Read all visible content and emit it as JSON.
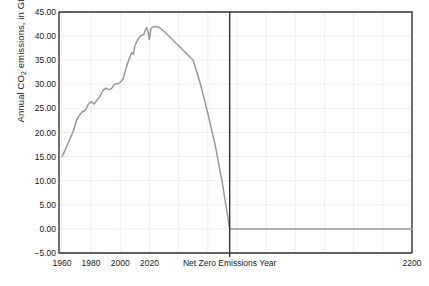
{
  "chart_data": {
    "type": "line",
    "title": "",
    "xlabel": "",
    "ylabel": "Annual CO2 emissions, in GtCO2",
    "ylabel_parts": {
      "prefix": "Annual CO",
      "sub1": "2",
      "middle": " emissions, in GtCO",
      "sub2": "2"
    },
    "ylim": [
      -5,
      45
    ],
    "yticks": [
      "-5.00",
      "0.00",
      "5.00",
      "10.00",
      "15.00",
      "20.00",
      "25.00",
      "30.00",
      "35.00",
      "40.00",
      "45.00"
    ],
    "ytick_values": [
      -5,
      0,
      5,
      10,
      15,
      20,
      25,
      30,
      35,
      40,
      45
    ],
    "xticks": [
      "1960",
      "1980",
      "2000",
      "2020",
      "Net Zero Emissions Year",
      "2200"
    ],
    "xtick_values": [
      1960,
      1980,
      2000,
      2020,
      2075,
      2200
    ],
    "xlim": [
      1958,
      2200
    ],
    "grid": true,
    "legend": "none",
    "net_zero_year": 2075,
    "net_zero_label": "Net Zero Emissions Year",
    "line_color": "#999999",
    "marker_line_color": "#333333",
    "grid_color": "#eeeeee",
    "axis_color": "#333333",
    "series": [
      {
        "name": "Annual CO2 emissions",
        "x": [
          1960,
          1962,
          1964,
          1966,
          1968,
          1970,
          1972,
          1974,
          1976,
          1978,
          1980,
          1982,
          1984,
          1986,
          1988,
          1990,
          1992,
          1994,
          1996,
          1998,
          2000,
          2002,
          2004,
          2006,
          2008,
          2009,
          2010,
          2012,
          2014,
          2016,
          2018,
          2019,
          2020,
          2021,
          2022,
          2024,
          2026,
          2028,
          2030,
          2035,
          2040,
          2045,
          2050,
          2055,
          2060,
          2065,
          2070,
          2075,
          2100,
          2150,
          2200
        ],
        "y": [
          15.0,
          16.2,
          17.6,
          19.0,
          20.4,
          22.5,
          23.6,
          24.3,
          24.6,
          25.8,
          26.4,
          25.9,
          26.7,
          27.5,
          28.7,
          29.2,
          28.9,
          29.1,
          30.0,
          30.1,
          30.4,
          31.2,
          33.4,
          35.2,
          36.6,
          36.2,
          38.0,
          39.3,
          40.1,
          40.3,
          41.8,
          41.0,
          39.3,
          41.5,
          41.9,
          42.0,
          41.9,
          41.5,
          41.0,
          39.5,
          38.0,
          36.5,
          35.0,
          30.0,
          24.0,
          17.5,
          9.5,
          0.0,
          0.0,
          0.0,
          0.0
        ]
      }
    ]
  }
}
